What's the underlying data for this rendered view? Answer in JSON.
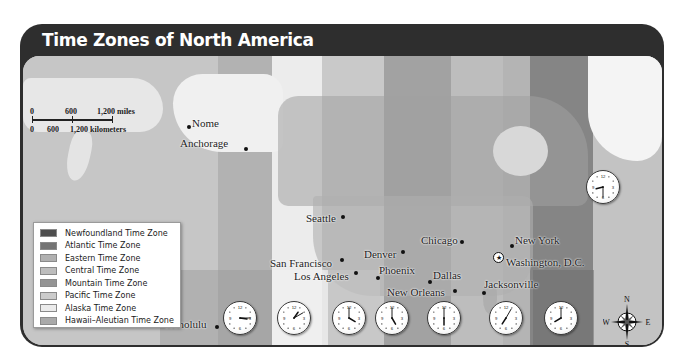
{
  "title": "Time Zones of North America",
  "colors": {
    "frame": "#2e2e2e",
    "newfoundland": "#5a5a5a",
    "atlantic": "#7e7e7e",
    "eastern": "#b3b3b3",
    "central": "#c2c2c2",
    "mountain": "#9d9d9d",
    "pacific": "#cfcfcf",
    "alaska": "#ececec",
    "hawaii_aleutian": "#aeaeae"
  },
  "scale_bar": {
    "miles_labels": [
      "0",
      "600",
      "1,200 miles"
    ],
    "km_labels": [
      "0",
      "600",
      "1,200 kilometers"
    ]
  },
  "legend": {
    "items": [
      {
        "label": "Newfoundland Time Zone",
        "color": "#4e4e4e"
      },
      {
        "label": "Atlantic Time Zone",
        "color": "#747474"
      },
      {
        "label": "Eastern Time Zone",
        "color": "#b0b0b0"
      },
      {
        "label": "Central Time Zone",
        "color": "#bdbdbd"
      },
      {
        "label": "Mountain Time Zone",
        "color": "#949494"
      },
      {
        "label": "Pacific Time Zone",
        "color": "#cbcbcb"
      },
      {
        "label": "Alaska Time Zone",
        "color": "#ebebeb"
      },
      {
        "label": "Hawaii–Aleutian Time Zone",
        "color": "#a9a9a9"
      }
    ]
  },
  "cities": [
    {
      "name": "Nome"
    },
    {
      "name": "Anchorage"
    },
    {
      "name": "Seattle"
    },
    {
      "name": "San Francisco"
    },
    {
      "name": "Los Angeles"
    },
    {
      "name": "Denver"
    },
    {
      "name": "Phoenix"
    },
    {
      "name": "Chicago"
    },
    {
      "name": "Dallas"
    },
    {
      "name": "New Orleans"
    },
    {
      "name": "New York"
    },
    {
      "name": "Washington, D.C.",
      "capital": true
    },
    {
      "name": "Jacksonville"
    },
    {
      "name": "Honolulu"
    }
  ],
  "clocks": [
    {
      "zone": "Hawaii–Aleutian",
      "time": "3:15",
      "hour": 3,
      "minute": 15
    },
    {
      "zone": "Alaska",
      "time": "1:10",
      "hour": 1,
      "minute": 10
    },
    {
      "zone": "Pacific",
      "time": "4:00",
      "hour": 4,
      "minute": 0
    },
    {
      "zone": "Mountain",
      "time": "5:00",
      "hour": 5,
      "minute": 0
    },
    {
      "zone": "Central",
      "time": "6:00",
      "hour": 6,
      "minute": 0
    },
    {
      "zone": "Eastern",
      "time": "7:05",
      "hour": 7,
      "minute": 5
    },
    {
      "zone": "Atlantic",
      "time": "8:00",
      "hour": 8,
      "minute": 0
    },
    {
      "zone": "Newfoundland",
      "time": "8:30",
      "hour": 8,
      "minute": 30
    }
  ],
  "clock_numerals": [
    "12",
    "3",
    "6",
    "9"
  ],
  "compass": {
    "n": "N",
    "s": "S",
    "e": "E",
    "w": "W"
  }
}
